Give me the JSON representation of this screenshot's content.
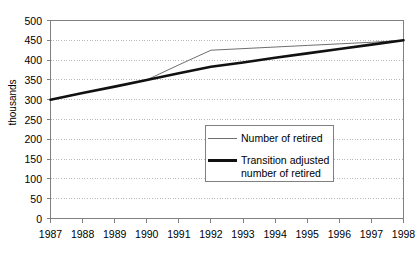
{
  "chart_data": {
    "type": "line",
    "title": "",
    "xlabel": "",
    "ylabel": "thousands",
    "x": [
      "1987",
      "1988",
      "1989",
      "1990",
      "1991",
      "1992",
      "1993",
      "1994",
      "1995",
      "1996",
      "1997",
      "1998"
    ],
    "ylim": [
      0,
      500
    ],
    "ytick_step": 50,
    "yticks": [
      "500",
      "450",
      "400",
      "350",
      "300",
      "250",
      "200",
      "150",
      "100",
      "50",
      "0"
    ],
    "grid": true,
    "grid_style": "dotted",
    "legend_position": "center",
    "series": [
      {
        "name": "Number of retired",
        "style": "thin",
        "color": "#6e6e6e",
        "values": [
          300,
          317,
          333,
          350,
          388,
          425,
          429,
          433,
          437,
          441,
          445,
          450
        ]
      },
      {
        "name": "Transition adjusted\nnumber of retired",
        "style": "thick",
        "color": "#111111",
        "values": [
          300,
          317,
          333,
          350,
          367,
          383,
          394,
          406,
          417,
          428,
          439,
          450
        ]
      }
    ]
  },
  "legend": {
    "items": [
      {
        "label": "Number of retired"
      },
      {
        "label": "Transition adjusted\nnumber of retired"
      }
    ]
  },
  "axes": {
    "y_title": "thousands"
  },
  "colors": {
    "axis": "#808080",
    "grid": "#b9b9b9",
    "series_thin": "#6e6e6e",
    "series_thick": "#111111",
    "background": "#ffffff"
  }
}
